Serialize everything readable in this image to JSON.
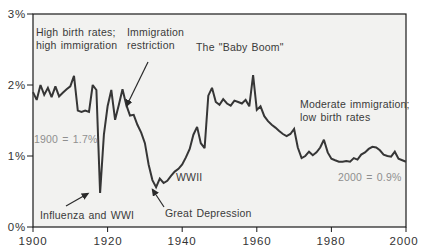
{
  "chart_data": {
    "type": "line",
    "title": "",
    "xlabel": "",
    "ylabel": "",
    "xlim": [
      1900,
      2000
    ],
    "ylim": [
      0,
      3
    ],
    "grid": false,
    "legend": false,
    "x_ticks": [
      1900,
      1920,
      1940,
      1960,
      1980,
      2000
    ],
    "y_ticks": [
      3,
      2,
      1,
      0
    ],
    "x_tick_labels": [
      "1900",
      "1920",
      "1940",
      "1960",
      "1980",
      "2000"
    ],
    "y_tick_labels": [
      "3%",
      "2%",
      "1%",
      "0%"
    ],
    "series": [
      {
        "name": "population_growth_rate_percent",
        "x": [
          1900,
          1901,
          1902,
          1903,
          1904,
          1905,
          1906,
          1907,
          1908,
          1909,
          1910,
          1911,
          1912,
          1913,
          1914,
          1915,
          1916,
          1917,
          1918,
          1919,
          1920,
          1921,
          1922,
          1923,
          1924,
          1925,
          1926,
          1927,
          1928,
          1929,
          1930,
          1931,
          1932,
          1933,
          1934,
          1935,
          1936,
          1937,
          1938,
          1939,
          1940,
          1941,
          1942,
          1943,
          1944,
          1945,
          1946,
          1947,
          1948,
          1949,
          1950,
          1951,
          1952,
          1953,
          1954,
          1955,
          1956,
          1957,
          1958,
          1959,
          1960,
          1961,
          1962,
          1963,
          1964,
          1965,
          1966,
          1967,
          1968,
          1969,
          1970,
          1971,
          1972,
          1973,
          1974,
          1975,
          1976,
          1977,
          1978,
          1979,
          1980,
          1981,
          1982,
          1983,
          1984,
          1985,
          1986,
          1987,
          1988,
          1989,
          1990,
          1991,
          1992,
          1993,
          1994,
          1995,
          1996,
          1997,
          1998,
          1999,
          2000
        ],
        "y": [
          1.9,
          1.79,
          2.0,
          1.86,
          1.96,
          1.83,
          1.98,
          1.84,
          1.89,
          1.94,
          1.98,
          2.13,
          1.64,
          1.62,
          1.64,
          1.62,
          2.0,
          1.93,
          0.48,
          1.3,
          1.7,
          1.93,
          1.51,
          1.72,
          1.94,
          1.72,
          1.57,
          1.58,
          1.44,
          1.33,
          1.18,
          0.88,
          0.66,
          0.56,
          0.68,
          0.62,
          0.65,
          0.72,
          0.78,
          0.82,
          0.88,
          0.98,
          1.1,
          1.3,
          1.41,
          1.18,
          1.11,
          1.85,
          1.96,
          1.76,
          1.72,
          1.8,
          1.74,
          1.71,
          1.78,
          1.76,
          1.74,
          1.79,
          1.7,
          2.14,
          1.65,
          1.7,
          1.56,
          1.49,
          1.44,
          1.4,
          1.35,
          1.31,
          1.28,
          1.31,
          1.38,
          1.12,
          0.97,
          1.0,
          1.06,
          1.01,
          1.05,
          1.12,
          1.23,
          1.05,
          0.96,
          0.94,
          0.92,
          0.92,
          0.93,
          0.92,
          0.97,
          0.95,
          1.02,
          1.05,
          1.1,
          1.13,
          1.12,
          1.08,
          1.02,
          1.0,
          0.99,
          1.06,
          0.96,
          0.94,
          0.92
        ]
      }
    ],
    "annotations": {
      "high_birth_rates": "High birth rates;\nhigh immigration",
      "immigration_restriction": "Immigration\nrestriction",
      "baby_boom": "The \"Baby Boom\"",
      "moderate_immigration": "Moderate immigration;\nlow birth rates",
      "value_1900": "1900 = 1.7%",
      "value_2000": "2000 = 0.9%",
      "influenza_wwi": "Influenza and WWI",
      "wwii": "WWII",
      "great_depression": "Great Depression"
    },
    "colors": {
      "line": "#363636",
      "plot_background": "#f2f2f0",
      "frame": "#1a1a1a",
      "muted_label": "#8f8f8f",
      "text": "#3a3a3a"
    }
  }
}
